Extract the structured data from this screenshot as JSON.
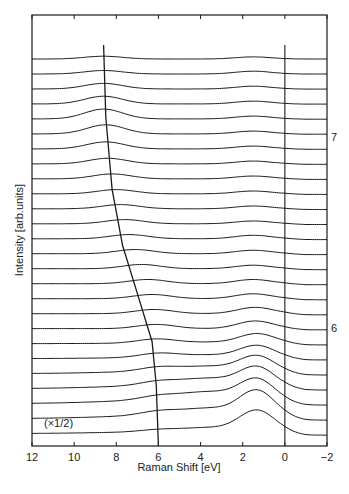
{
  "chart_data": {
    "type": "line",
    "title": "",
    "xlabel": "Raman Shift [eV]",
    "ylabel": "Intensity [arb.units]",
    "xlim": [
      12,
      -2
    ],
    "x_ticks": [
      12,
      10,
      8,
      6,
      4,
      2,
      0,
      -2
    ],
    "x_tick_labels": [
      "12",
      "10",
      "8",
      "6",
      "4",
      "2",
      "0",
      "−2"
    ],
    "grid": false,
    "legend": null,
    "layout": "stacked waterfall spectra, offset vertically, bottom trace scaled",
    "annotations": [
      {
        "text": "(×1/2)",
        "near": "bottom trace",
        "x": 11.0
      },
      {
        "text": "7",
        "side": "right",
        "trace_index_from_top": 6
      },
      {
        "text": "6",
        "side": "right",
        "trace_index_from_top": 19
      }
    ],
    "guide_lines": [
      {
        "name": "dispersing-feature-line",
        "x_top": 8.6,
        "x_bottom": 6.0,
        "points": [
          [
            8.6,
            0
          ],
          [
            8.5,
            0.18
          ],
          [
            8.2,
            0.36
          ],
          [
            7.7,
            0.5
          ],
          [
            7.0,
            0.62
          ],
          [
            6.3,
            0.74
          ],
          [
            6.1,
            0.85
          ],
          [
            6.0,
            1.0
          ]
        ]
      },
      {
        "name": "zero-shift-line",
        "x": 0
      }
    ],
    "series_count": 26,
    "series": [
      {
        "name": "trace-1",
        "peak_x": 8.6,
        "peak_h": 0.4,
        "low_peak_x": 1.5,
        "low_peak_h": 0.3,
        "bg": 0.0
      },
      {
        "name": "trace-2",
        "peak_x": 8.6,
        "peak_h": 0.5,
        "low_peak_x": 1.5,
        "low_peak_h": 0.4,
        "bg": 0.0
      },
      {
        "name": "trace-3",
        "peak_x": 8.6,
        "peak_h": 0.8,
        "low_peak_x": 1.5,
        "low_peak_h": 0.4,
        "bg": 0.0
      },
      {
        "name": "trace-4",
        "peak_x": 8.6,
        "peak_h": 1.1,
        "low_peak_x": 1.5,
        "low_peak_h": 0.4,
        "bg": 0.0
      },
      {
        "name": "trace-5",
        "peak_x": 8.6,
        "peak_h": 1.4,
        "low_peak_x": 1.5,
        "low_peak_h": 0.4,
        "bg": 0.0
      },
      {
        "name": "trace-6",
        "peak_x": 8.5,
        "peak_h": 1.3,
        "low_peak_x": 1.5,
        "low_peak_h": 0.4,
        "bg": 0.0
      },
      {
        "name": "trace-7",
        "peak_x": 8.5,
        "peak_h": 1.0,
        "low_peak_x": 1.5,
        "low_peak_h": 0.4,
        "bg": 0.0
      },
      {
        "name": "trace-8",
        "peak_x": 8.4,
        "peak_h": 0.8,
        "low_peak_x": 1.5,
        "low_peak_h": 0.4,
        "bg": 0.0
      },
      {
        "name": "trace-9",
        "peak_x": 8.2,
        "peak_h": 0.7,
        "low_peak_x": 1.5,
        "low_peak_h": 0.4,
        "bg": 0.0
      },
      {
        "name": "trace-10",
        "peak_x": 8.0,
        "peak_h": 0.6,
        "low_peak_x": 1.5,
        "low_peak_h": 0.4,
        "bg": 0.0
      },
      {
        "name": "trace-11",
        "peak_x": 7.8,
        "peak_h": 0.6,
        "low_peak_x": 1.5,
        "low_peak_h": 0.4,
        "bg": 0.0
      },
      {
        "name": "trace-12",
        "peak_x": 7.6,
        "peak_h": 0.6,
        "low_peak_x": 1.5,
        "low_peak_h": 0.4,
        "bg": 0.0
      },
      {
        "name": "trace-13",
        "peak_x": 7.4,
        "peak_h": 0.6,
        "low_peak_x": 1.5,
        "low_peak_h": 0.5,
        "bg": 0.0
      },
      {
        "name": "trace-14",
        "peak_x": 7.1,
        "peak_h": 0.6,
        "low_peak_x": 1.5,
        "low_peak_h": 0.5,
        "bg": 0.0
      },
      {
        "name": "trace-15",
        "peak_x": 6.8,
        "peak_h": 0.6,
        "low_peak_x": 1.5,
        "low_peak_h": 0.5,
        "bg": 0.0
      },
      {
        "name": "trace-16",
        "peak_x": 6.5,
        "peak_h": 0.6,
        "low_peak_x": 1.5,
        "low_peak_h": 0.6,
        "bg": 0.0
      },
      {
        "name": "trace-17",
        "peak_x": 6.3,
        "peak_h": 0.6,
        "low_peak_x": 1.5,
        "low_peak_h": 0.7,
        "bg": 0.0
      },
      {
        "name": "trace-18",
        "peak_x": 6.2,
        "peak_h": 0.6,
        "low_peak_x": 1.4,
        "low_peak_h": 0.9,
        "bg": 0.0
      },
      {
        "name": "trace-19",
        "peak_x": 6.1,
        "peak_h": 0.6,
        "low_peak_x": 1.4,
        "low_peak_h": 1.1,
        "bg": 0.0
      },
      {
        "name": "trace-20",
        "peak_x": 6.1,
        "peak_h": 0.6,
        "low_peak_x": 1.3,
        "low_peak_h": 1.4,
        "bg": 0.2
      },
      {
        "name": "trace-21",
        "peak_x": 6.0,
        "peak_h": 0.6,
        "low_peak_x": 1.3,
        "low_peak_h": 1.8,
        "bg": 0.5
      },
      {
        "name": "trace-22",
        "peak_x": 6.0,
        "peak_h": 0.6,
        "low_peak_x": 1.3,
        "low_peak_h": 2.4,
        "bg": 1.0
      },
      {
        "name": "trace-23",
        "peak_x": 6.0,
        "peak_h": 0.6,
        "low_peak_x": 1.3,
        "low_peak_h": 2.9,
        "bg": 1.4
      },
      {
        "name": "trace-24",
        "peak_x": 6.0,
        "peak_h": 0.6,
        "low_peak_x": 1.3,
        "low_peak_h": 3.3,
        "bg": 1.6
      },
      {
        "name": "trace-25",
        "peak_x": 6.0,
        "peak_h": 0.6,
        "low_peak_x": 1.3,
        "low_peak_h": 3.8,
        "bg": 1.4
      },
      {
        "name": "trace-26 (x1/2)",
        "peak_x": 6.0,
        "peak_h": 0.3,
        "low_peak_x": 1.3,
        "low_peak_h": 3.2,
        "bg": 0.8
      }
    ]
  },
  "labels": {
    "xlabel": "Raman Shift [eV]",
    "ylabel": "Intensity [arb.units]",
    "scale_note": "(×1/2)",
    "right_label_7": "7",
    "right_label_6": "6"
  },
  "colors": {
    "line": "#1a1a1a",
    "background": "#ffffff"
  }
}
